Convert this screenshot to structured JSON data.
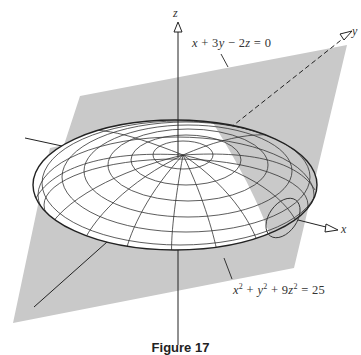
{
  "figure": {
    "axes": {
      "x_label": "x",
      "y_label": "y",
      "z_label": "z"
    },
    "plane_equation": {
      "text": "x + 3y − 2z = 0",
      "parts": [
        "x",
        "+ 3",
        "y",
        "− 2",
        "z",
        "= 0"
      ]
    },
    "ellipsoid_equation": {
      "text": "x² + y² + 9z² = 25",
      "t1": "x",
      "s1": "2",
      "t2": "+ ",
      "t3": "y",
      "s2": "2",
      "t4": "+ 9",
      "t5": "z",
      "s3": "2",
      "t6": "= 25"
    },
    "caption": "Figure 17",
    "colors": {
      "plane": "#c9c9c9",
      "lines": "#2a2a2a",
      "ellipsoid": "#ffffff"
    }
  }
}
